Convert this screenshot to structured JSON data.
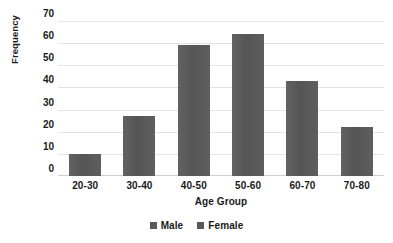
{
  "chart_data": {
    "type": "bar",
    "title": "",
    "xlabel": "Age Group",
    "ylabel": "Frequency",
    "categories": [
      "20-30",
      "30-40",
      "40-50",
      "50-60",
      "60-70",
      "70-80"
    ],
    "values": [
      10,
      27,
      59,
      64,
      43,
      22
    ],
    "series": [
      {
        "name": "Male",
        "values": [
          10,
          27,
          59,
          64,
          43,
          22
        ]
      }
    ],
    "ylim": [
      0,
      70
    ],
    "ytick_labels": [
      "70",
      "60",
      "50",
      "40",
      "30",
      "20",
      "10",
      "0"
    ],
    "ytick_values": [
      70,
      60,
      50,
      40,
      30,
      20,
      10,
      0
    ],
    "ystep": 10,
    "grid": "horizontal",
    "legend_position": "bottom",
    "legend": [
      {
        "label": "Male",
        "color": "#595959"
      },
      {
        "label": "Female",
        "color": "#595959"
      }
    ],
    "bar_color": "#595959",
    "gridline_color": "#e3e3e3",
    "text_color": "#1a1a1a",
    "background": "#ffffff"
  }
}
